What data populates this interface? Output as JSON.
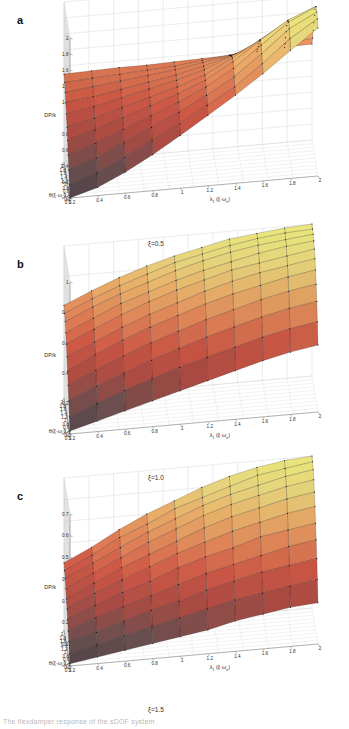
{
  "figure": {
    "top_partial_text": "· · · · ·",
    "bottom_partial_caption": "The flexdamper response of the sDOF system",
    "zaxis_label": "DP/k",
    "xaxis_label_main": "θ(",
    "xaxis_label_paren": "ξ·ω",
    "xaxis_label_sub": "n",
    "xaxis_label_close": ")",
    "yaxis_label_main": "λ",
    "yaxis_label_main_sub": "1",
    "yaxis_label_paren": " (ξ·ω",
    "yaxis_label_sub": "n",
    "yaxis_label_close": ")"
  },
  "panels": [
    {
      "letter": "a",
      "xi_caption": "ξ=0.5",
      "zticks": [
        "2",
        "1.8",
        "1.6",
        "1.4",
        "1.2",
        "1",
        "0.8",
        "0.6",
        "0.4",
        "0.2",
        "0"
      ],
      "xticks": [
        "2",
        "1.8",
        "1.6",
        "1.4",
        "1.2",
        "1",
        "0.8",
        "0.6",
        "0.4",
        "0.2",
        "0.1"
      ],
      "yticks": [
        "0.2",
        "0.4",
        "0.6",
        "0.8",
        "1",
        "1.2",
        "1.4",
        "1.6",
        "1.8",
        "2"
      ]
    },
    {
      "letter": "b",
      "xi_caption": "ξ=1.0",
      "zticks": [
        "1",
        "0.8",
        "0.6",
        "0.4",
        "0.2",
        "0"
      ],
      "xticks": [
        "2",
        "1.8",
        "1.6",
        "1.4",
        "1.2",
        "1",
        "0.8",
        "0.6",
        "0.4",
        "0.2",
        "0.1"
      ],
      "yticks": [
        "0.2",
        "0.4",
        "0.6",
        "0.8",
        "1",
        "1.2",
        "1.4",
        "1.6",
        "1.8",
        "2"
      ]
    },
    {
      "letter": "c",
      "xi_caption": "ξ=1.5",
      "zticks": [
        "0.7",
        "0.6",
        "0.5",
        "0.4",
        "0.3",
        "0.2",
        "0.1",
        "0"
      ],
      "xticks": [
        "2",
        "1.8",
        "1.6",
        "1.4",
        "1.2",
        "1",
        "0.8",
        "0.6",
        "0.4",
        "0.2",
        "0.1"
      ],
      "yticks": [
        "0.2",
        "0.4",
        "0.6",
        "0.8",
        "1",
        "1.2",
        "1.4",
        "1.6",
        "1.8",
        "2"
      ]
    }
  ],
  "colors": {
    "peak_yellow": "#e9e87c",
    "mid_orange": "#e8a763",
    "red": "#cf5846",
    "dark_valley": "#4a4348",
    "grid": "#c9c9c9",
    "axis": "#6e6e6e",
    "mesh_line": "#000000"
  },
  "chart_data": [
    {
      "type": "surface",
      "panel": "a",
      "title": "DP/k surface at ξ=0.5",
      "xlabel": "θ(ξ·ωn)",
      "ylabel": "λ1 (ξ·ωn)",
      "zlabel": "DP/k",
      "xlim": [
        0.1,
        2
      ],
      "ylim": [
        0.2,
        2
      ],
      "zlim": [
        0,
        2
      ],
      "ztick_step": 0.2,
      "grid": true,
      "description": "Broad saddle sheet near DP/k=1.1 at low lambda falling to ~0 at the theta=0.1 / lambda=0.2 front corner, with a tall yellow resonance ridge rising to ~2 along the high-lambda edge",
      "x": [
        0.1,
        0.29,
        0.48,
        0.67,
        0.86,
        1.05,
        1.24,
        1.43,
        1.62,
        1.81,
        2.0
      ],
      "y": [
        0.2,
        0.4,
        0.6,
        0.8,
        1.0,
        1.2,
        1.4,
        1.6,
        1.8,
        2.0
      ],
      "z": [
        [
          0.0,
          0.1,
          0.26,
          0.45,
          0.66,
          0.88,
          1.1,
          1.34,
          1.6,
          1.85
        ],
        [
          0.12,
          0.24,
          0.4,
          0.58,
          0.76,
          0.96,
          1.16,
          1.42,
          1.7,
          1.92
        ],
        [
          0.26,
          0.38,
          0.54,
          0.7,
          0.86,
          1.04,
          1.24,
          1.5,
          1.78,
          1.96
        ],
        [
          0.4,
          0.52,
          0.66,
          0.8,
          0.94,
          1.1,
          1.3,
          1.56,
          1.82,
          1.98
        ],
        [
          0.54,
          0.64,
          0.76,
          0.88,
          1.0,
          1.14,
          1.34,
          1.58,
          1.8,
          1.94
        ],
        [
          0.66,
          0.74,
          0.84,
          0.94,
          1.04,
          1.16,
          1.34,
          1.54,
          1.74,
          1.86
        ],
        [
          0.78,
          0.84,
          0.92,
          1.0,
          1.08,
          1.18,
          1.32,
          1.48,
          1.64,
          1.74
        ],
        [
          0.88,
          0.92,
          0.98,
          1.04,
          1.1,
          1.18,
          1.28,
          1.4,
          1.52,
          1.6
        ],
        [
          0.96,
          1.0,
          1.04,
          1.08,
          1.12,
          1.18,
          1.24,
          1.32,
          1.4,
          1.46
        ],
        [
          1.04,
          1.06,
          1.08,
          1.1,
          1.12,
          1.16,
          1.2,
          1.24,
          1.28,
          1.32
        ],
        [
          1.1,
          1.11,
          1.12,
          1.12,
          1.13,
          1.14,
          1.15,
          1.17,
          1.19,
          1.2
        ]
      ]
    },
    {
      "type": "surface",
      "panel": "b",
      "title": "DP/k surface at ξ=1.0",
      "xlabel": "θ(ξ·ωn)",
      "ylabel": "λ1 (ξ·ωn)",
      "zlabel": "DP/k",
      "xlim": [
        0.1,
        2
      ],
      "ylim": [
        0.2,
        2
      ],
      "zlim": [
        0,
        1
      ],
      "ztick_step": 0.2,
      "grid": true,
      "description": "Smooth monotone dome: DP/k near 0 at the theta=0.1 / lambda=0.2 corner rising to about 1.0 at the far theta=2 / lambda=2 corner, 0.61 at the left corner and 0.44 at the right corner",
      "x": [
        0.1,
        0.29,
        0.48,
        0.67,
        0.86,
        1.05,
        1.24,
        1.43,
        1.62,
        1.81,
        2.0
      ],
      "y": [
        0.2,
        0.4,
        0.6,
        0.8,
        1.0,
        1.2,
        1.4,
        1.6,
        1.8,
        2.0
      ],
      "z": [
        [
          0.02,
          0.07,
          0.12,
          0.17,
          0.22,
          0.27,
          0.32,
          0.37,
          0.41,
          0.44
        ],
        [
          0.09,
          0.16,
          0.23,
          0.29,
          0.35,
          0.4,
          0.45,
          0.5,
          0.54,
          0.57
        ],
        [
          0.17,
          0.25,
          0.32,
          0.39,
          0.45,
          0.51,
          0.56,
          0.61,
          0.65,
          0.68
        ],
        [
          0.25,
          0.33,
          0.41,
          0.48,
          0.54,
          0.6,
          0.65,
          0.7,
          0.74,
          0.77
        ],
        [
          0.32,
          0.41,
          0.49,
          0.56,
          0.62,
          0.68,
          0.73,
          0.77,
          0.81,
          0.84
        ],
        [
          0.39,
          0.47,
          0.55,
          0.62,
          0.68,
          0.74,
          0.79,
          0.83,
          0.86,
          0.89
        ],
        [
          0.45,
          0.53,
          0.61,
          0.68,
          0.74,
          0.79,
          0.84,
          0.87,
          0.9,
          0.93
        ],
        [
          0.5,
          0.58,
          0.66,
          0.72,
          0.78,
          0.83,
          0.87,
          0.91,
          0.94,
          0.96
        ],
        [
          0.55,
          0.63,
          0.7,
          0.76,
          0.82,
          0.87,
          0.91,
          0.94,
          0.96,
          0.98
        ],
        [
          0.58,
          0.66,
          0.73,
          0.79,
          0.85,
          0.89,
          0.93,
          0.96,
          0.98,
          0.99
        ],
        [
          0.61,
          0.69,
          0.76,
          0.82,
          0.87,
          0.91,
          0.95,
          0.97,
          0.99,
          1.0
        ]
      ]
    },
    {
      "type": "surface",
      "panel": "c",
      "title": "DP/k surface at ξ=1.5",
      "xlabel": "θ(ξ·ωn)",
      "ylabel": "λ1 (ξ·ωn)",
      "zlabel": "DP/k",
      "xlim": [
        0.1,
        2
      ],
      "ylim": [
        0.2,
        2
      ],
      "zlim": [
        0,
        0.7
      ],
      "ztick_step": 0.1,
      "grid": true,
      "description": "Near-planar tilted sheet: DP/k about 0 at the theta=0.1 / lambda=0.2 corner rising to roughly 0.7 at the far theta=2 / lambda=2 corner, 0.31 at the left corner and 0.19 at the right corner",
      "x": [
        0.1,
        0.29,
        0.48,
        0.67,
        0.86,
        1.05,
        1.24,
        1.43,
        1.62,
        1.81,
        2.0
      ],
      "y": [
        0.2,
        0.4,
        0.6,
        0.8,
        1.0,
        1.2,
        1.4,
        1.6,
        1.8,
        2.0
      ],
      "z": [
        [
          0.01,
          0.03,
          0.05,
          0.07,
          0.09,
          0.11,
          0.14,
          0.16,
          0.18,
          0.19
        ],
        [
          0.04,
          0.07,
          0.1,
          0.13,
          0.16,
          0.19,
          0.22,
          0.24,
          0.26,
          0.28
        ],
        [
          0.08,
          0.11,
          0.15,
          0.19,
          0.22,
          0.26,
          0.29,
          0.32,
          0.34,
          0.36
        ],
        [
          0.11,
          0.16,
          0.2,
          0.24,
          0.28,
          0.32,
          0.35,
          0.38,
          0.41,
          0.43
        ],
        [
          0.15,
          0.2,
          0.25,
          0.29,
          0.34,
          0.38,
          0.41,
          0.45,
          0.47,
          0.49
        ],
        [
          0.18,
          0.24,
          0.29,
          0.34,
          0.39,
          0.43,
          0.47,
          0.5,
          0.53,
          0.55
        ],
        [
          0.21,
          0.27,
          0.33,
          0.38,
          0.43,
          0.48,
          0.52,
          0.55,
          0.58,
          0.6
        ],
        [
          0.24,
          0.3,
          0.36,
          0.42,
          0.47,
          0.52,
          0.56,
          0.59,
          0.62,
          0.64
        ],
        [
          0.27,
          0.33,
          0.39,
          0.45,
          0.5,
          0.55,
          0.59,
          0.62,
          0.65,
          0.67
        ],
        [
          0.29,
          0.35,
          0.42,
          0.47,
          0.53,
          0.57,
          0.61,
          0.65,
          0.67,
          0.69
        ],
        [
          0.31,
          0.37,
          0.44,
          0.5,
          0.55,
          0.6,
          0.64,
          0.67,
          0.69,
          0.7
        ]
      ]
    }
  ]
}
